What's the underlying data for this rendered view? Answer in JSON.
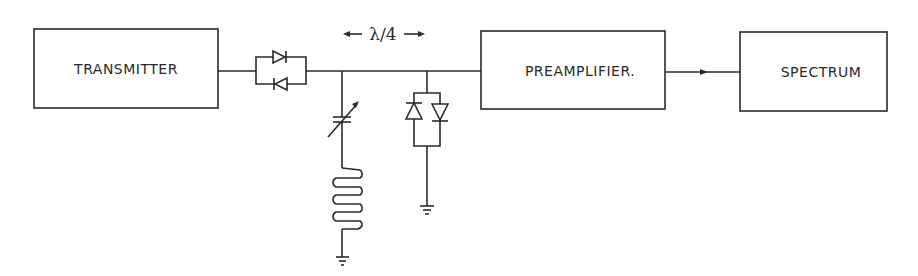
{
  "diagram": {
    "type": "block-circuit",
    "blocks": [
      {
        "id": "transmitter",
        "label": "TRANSMITTER"
      },
      {
        "id": "preamplifier",
        "label": "PREAMPLIFIER."
      },
      {
        "id": "spectrum",
        "label": "SPECTRUM"
      }
    ],
    "annotations": {
      "line_length": "λ/4"
    },
    "components": [
      {
        "id": "series-diode-pair",
        "kind": "anti-parallel diodes"
      },
      {
        "id": "variable-capacitor",
        "kind": "variable capacitor"
      },
      {
        "id": "inductor",
        "kind": "coil"
      },
      {
        "id": "shunt-diode-pair",
        "kind": "anti-parallel diodes"
      },
      {
        "id": "ground-1",
        "kind": "ground"
      },
      {
        "id": "ground-2",
        "kind": "ground"
      }
    ],
    "colors": {
      "ink": "#2a2a2a",
      "background": "#ffffff"
    }
  }
}
